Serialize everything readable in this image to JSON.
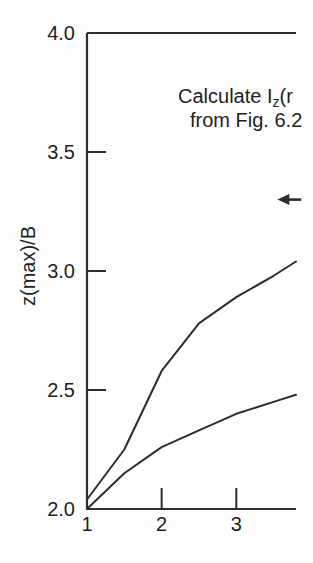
{
  "figure": {
    "background": "#fefefe",
    "ink_color": "#2d2d2d"
  },
  "chart_data": {
    "type": "line",
    "title": "",
    "xlabel": "",
    "ylabel": "z(max)/B",
    "xlim": [
      1.0,
      3.8
    ],
    "ylim": [
      2.0,
      4.0
    ],
    "grid": false,
    "legend": "none",
    "x_ticks": [
      {
        "value": 1,
        "label": "1",
        "mark": false
      },
      {
        "value": 2,
        "label": "2",
        "mark": true
      },
      {
        "value": 3,
        "label": "3",
        "mark": true
      }
    ],
    "y_ticks": [
      {
        "value": 2.0,
        "label": "2.0",
        "mark": false
      },
      {
        "value": 2.5,
        "label": "2.5",
        "mark": true
      },
      {
        "value": 3.0,
        "label": "3.0",
        "mark": true
      },
      {
        "value": 3.5,
        "label": "3.5",
        "mark": true
      },
      {
        "value": 4.0,
        "label": "4.0",
        "mark": false
      }
    ],
    "x": [
      1.0,
      1.5,
      2.0,
      2.5,
      3.0,
      3.5,
      3.8
    ],
    "series": [
      {
        "name": "upper-curve",
        "values": [
          2.04,
          2.25,
          2.58,
          2.78,
          2.89,
          2.98,
          3.04
        ]
      },
      {
        "name": "lower-curve",
        "values": [
          2.0,
          2.15,
          2.26,
          2.33,
          2.4,
          2.45,
          2.48
        ]
      }
    ],
    "annotations": [
      {
        "type": "text",
        "line1_pre": "Calculate I",
        "line1_sub": "z",
        "line1_post": "(r",
        "line2": "from Fig. 6.2"
      },
      {
        "type": "arrow",
        "direction": "left",
        "y_value": 3.3,
        "x_head": 3.55,
        "x_tail": 3.87
      }
    ]
  }
}
